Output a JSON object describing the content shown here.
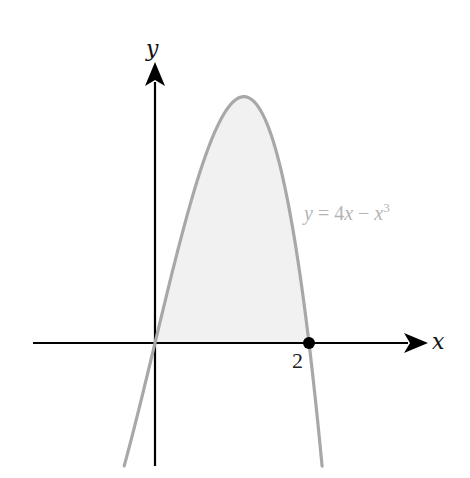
{
  "figure": {
    "type": "function-graph",
    "x_axis_label": "x",
    "y_axis_label": "y",
    "tick_label_x": "2",
    "curve_label": {
      "y": "y",
      "eq": " = 4",
      "x1": "x",
      "minus": " − ",
      "x2": "x",
      "exp": "3"
    },
    "colors": {
      "axes": "#000000",
      "curve": "#a8a8a8",
      "shade": "#f1f1f1",
      "label": "#b4b4b4",
      "point": "#000000"
    }
  },
  "chart_data": {
    "type": "line",
    "title": "",
    "function": "y = 4x - x^3",
    "xlabel": "x",
    "ylabel": "y",
    "xlim": [
      -0.4,
      2.17
    ],
    "ylim": [
      -1.55,
      3.2
    ],
    "shaded_region": {
      "from_x": 0,
      "to_x": 2,
      "between": "curve and x-axis"
    },
    "marked_points": [
      {
        "x": 2,
        "y": 0,
        "label": "2"
      }
    ],
    "x_ticks": [
      2
    ],
    "grid": false,
    "legend": "none",
    "annotations": [
      "y = 4x − x³"
    ]
  }
}
